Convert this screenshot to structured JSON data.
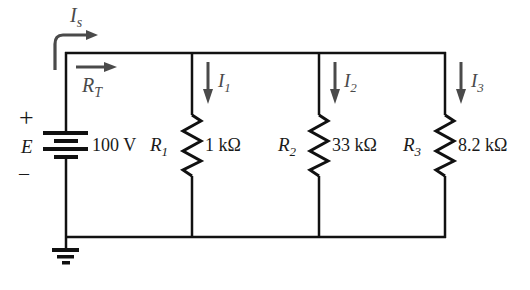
{
  "diagram": {
    "type": "parallel-circuit",
    "source": {
      "name": "E",
      "value": "100 V",
      "plus": "+",
      "minus": "–",
      "current_label_main": "I",
      "current_label_sub": "s"
    },
    "total_resistance": {
      "label_main": "R",
      "label_sub": "T"
    },
    "branches": [
      {
        "resistor_main": "R",
        "resistor_sub": "1",
        "value": "1 kΩ",
        "current_main": "I",
        "current_sub": "1"
      },
      {
        "resistor_main": "R",
        "resistor_sub": "2",
        "value": "33 kΩ",
        "current_main": "I",
        "current_sub": "2"
      },
      {
        "resistor_main": "R",
        "resistor_sub": "3",
        "value": "8.2 kΩ",
        "current_main": "I",
        "current_sub": "3"
      }
    ],
    "ground": "ground-symbol"
  }
}
